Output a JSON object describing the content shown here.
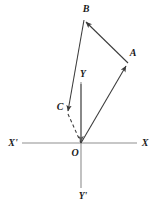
{
  "figure": {
    "background_color": "#ffffff",
    "stroke_color": "#3a3a3a",
    "axis_color": "#8a8a8a",
    "label_color": "#1a1a1a",
    "width": 159,
    "height": 207
  },
  "axes": {
    "origin_label": "O",
    "x_positive_label": "X",
    "x_negative_label": "X'",
    "y_positive_label": "Y",
    "y_negative_label": "Y'",
    "origin": {
      "x": 81,
      "y": 143
    },
    "x_axis": {
      "x1": 22,
      "y1": 143,
      "x2": 137,
      "y2": 143
    },
    "y_axis": {
      "x1": 81,
      "y1": 82,
      "x2": 81,
      "y2": 188
    },
    "label_positions": {
      "O": {
        "x": 75,
        "y": 152
      },
      "X": {
        "x": 145,
        "y": 143
      },
      "X'": {
        "x": 12,
        "y": 143
      },
      "Y": {
        "x": 82,
        "y": 75
      },
      "Y'": {
        "x": 82,
        "y": 197
      }
    }
  },
  "points": {
    "A": {
      "label": "A",
      "x": 127,
      "y": 64,
      "label_x": 132,
      "label_y": 53
    },
    "B": {
      "label": "B",
      "x": 84,
      "y": 20,
      "label_x": 86,
      "label_y": 9
    },
    "C": {
      "label": "C",
      "x": 68,
      "y": 113,
      "label_x": 60,
      "label_y": 107
    },
    "O": {
      "label": "O",
      "x": 81,
      "y": 143
    }
  },
  "vectors": [
    {
      "name": "OA",
      "from": "O",
      "to": "A",
      "style": "solid",
      "arrow": true,
      "x1": 81,
      "y1": 143,
      "x2": 127,
      "y2": 64
    },
    {
      "name": "AB",
      "from": "A",
      "to": "B",
      "style": "solid",
      "arrow": true,
      "x1": 127,
      "y1": 64,
      "x2": 84,
      "y2": 20
    },
    {
      "name": "BC",
      "from": "B",
      "to": "C",
      "style": "solid",
      "arrow": true,
      "x1": 84,
      "y1": 20,
      "x2": 68,
      "y2": 113
    },
    {
      "name": "CO",
      "from": "C",
      "to": "O",
      "style": "dashed",
      "arrow": false,
      "x1": 68,
      "y1": 113,
      "x2": 81,
      "y2": 143
    }
  ],
  "y_axis_arrow": {
    "tip_x": 81,
    "tip_y": 143,
    "note": "arrow along positive Y toward origin"
  }
}
